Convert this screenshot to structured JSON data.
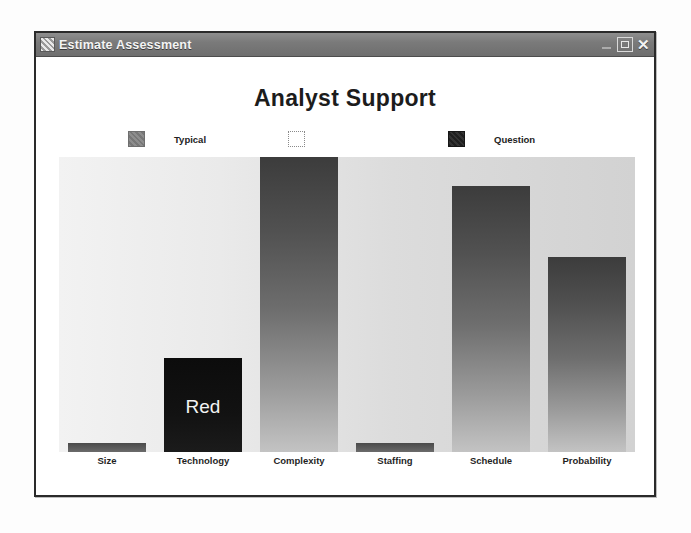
{
  "window": {
    "title": "Estimate Assessment",
    "icon": "app-icon",
    "buttons": {
      "minimize": "minimize-icon",
      "maximize": "maximize-icon",
      "close": "✕"
    }
  },
  "chart_data": {
    "type": "bar",
    "title": "Analyst Support",
    "xlabel": "",
    "ylabel": "",
    "grid": false,
    "ylim": [
      0,
      100
    ],
    "legend_position": "top",
    "legend": [
      {
        "label": "Typical",
        "color": "#808080",
        "swatch": "gray"
      },
      {
        "label": "",
        "color": "#ffffff",
        "swatch": "white"
      },
      {
        "label": "Question",
        "color": "#1f1f1f",
        "swatch": "dark"
      }
    ],
    "categories": [
      "Size",
      "Technology",
      "Complexity",
      "Staffing",
      "Schedule",
      "Probability"
    ],
    "values": [
      3,
      32,
      100,
      3,
      90,
      66
    ],
    "bar_colors": [
      "#5d5d5d",
      "#111111",
      "#4a4a4a",
      "#5d5d5d",
      "#4a4a4a",
      "#4a4a4a"
    ],
    "bar_styles": [
      "sliver",
      "black",
      "gradient",
      "sliver",
      "gradient",
      "gradient"
    ],
    "annotations": [
      {
        "category": "Technology",
        "text": "Red",
        "color": "#f2f2f2"
      }
    ]
  }
}
